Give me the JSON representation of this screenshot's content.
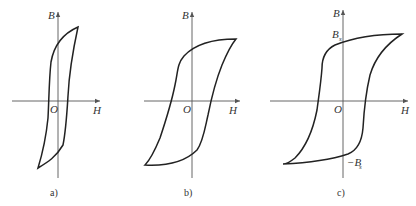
{
  "figure": {
    "panels": [
      {
        "id": "a",
        "caption": "a)",
        "x_label": "H",
        "y_label": "B",
        "origin_label": "O",
        "description": "Narrow hysteresis loop (soft magnetic material)"
      },
      {
        "id": "b",
        "caption": "b)",
        "x_label": "H",
        "y_label": "B",
        "origin_label": "O",
        "description": "Wide hysteresis loop (hard magnetic material)"
      },
      {
        "id": "c",
        "caption": "c)",
        "x_label": "H",
        "y_label": "B",
        "origin_label": "O",
        "bs_label": "B",
        "bs_sub": "s",
        "neg_bs_label": "−B",
        "neg_bs_sub": "s",
        "description": "Rectangular hysteresis loop (square-loop material)"
      }
    ]
  },
  "colors": {
    "curve": "#222222",
    "axis": "#555555",
    "background": "#ffffff"
  }
}
